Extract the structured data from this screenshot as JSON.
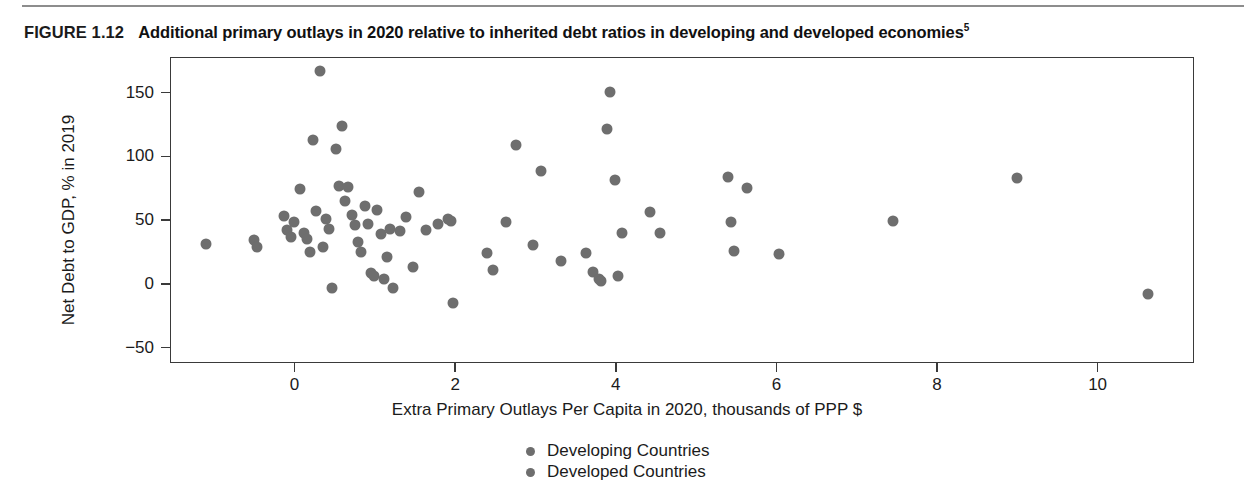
{
  "figure": {
    "number_label": "FIGURE 1.12",
    "title": "Additional primary outlays in 2020 relative to inherited debt ratios in developing and developed economies",
    "title_footnote": "5"
  },
  "chart_data": {
    "type": "scatter",
    "title": "Additional primary outlays in 2020 relative to inherited debt ratios in developing and developed economies",
    "xlabel": "Extra Primary Outlays Per Capita in 2020, thousands of PPP $",
    "ylabel": "Net Debt to GDP, % in 2019",
    "xlim": [
      -1.55,
      11.2
    ],
    "ylim": [
      -62,
      178
    ],
    "xticks": [
      0,
      2,
      4,
      6,
      8,
      10
    ],
    "yticks": [
      -50,
      0,
      50,
      100,
      150
    ],
    "xtick_labels": [
      "0",
      "2",
      "4",
      "6",
      "8",
      "10"
    ],
    "ytick_labels": [
      "−50",
      "0",
      "50",
      "100",
      "150"
    ],
    "grid": false,
    "legend_position": "bottom-center",
    "marker_color": "#6e6e6e",
    "series": [
      {
        "name": "Developing Countries",
        "color": "#6e6e6e",
        "points": [
          [
            -1.12,
            32
          ],
          [
            -0.52,
            35
          ],
          [
            -0.48,
            30
          ],
          [
            -0.14,
            54
          ],
          [
            -0.1,
            43
          ],
          [
            -0.06,
            38
          ],
          [
            -0.02,
            49
          ],
          [
            0.06,
            75
          ],
          [
            0.1,
            41
          ],
          [
            0.14,
            36
          ],
          [
            0.18,
            26
          ],
          [
            0.22,
            114
          ],
          [
            0.26,
            58
          ],
          [
            0.3,
            168
          ],
          [
            0.34,
            30
          ],
          [
            0.38,
            52
          ],
          [
            0.42,
            44
          ],
          [
            0.46,
            -2
          ],
          [
            0.5,
            107
          ],
          [
            0.54,
            78
          ],
          [
            0.58,
            125
          ],
          [
            0.62,
            66
          ],
          [
            0.66,
            77
          ],
          [
            0.7,
            55
          ],
          [
            0.74,
            47
          ],
          [
            0.78,
            34
          ],
          [
            0.82,
            26
          ],
          [
            0.86,
            62
          ],
          [
            0.9,
            48
          ],
          [
            0.94,
            9
          ],
          [
            0.98,
            7
          ],
          [
            1.02,
            59
          ],
          [
            1.06,
            40
          ],
          [
            1.1,
            5
          ],
          [
            1.14,
            22
          ],
          [
            1.18,
            44
          ],
          [
            1.22,
            -2
          ],
          [
            1.3,
            42
          ],
          [
            1.38,
            53
          ],
          [
            1.46,
            14
          ],
          [
            1.54,
            73
          ],
          [
            1.62,
            43
          ],
          [
            1.78,
            48
          ],
          [
            1.9,
            52
          ],
          [
            1.94,
            50
          ],
          [
            1.96,
            -14
          ],
          [
            2.38,
            25
          ],
          [
            2.46,
            12
          ],
          [
            2.62,
            49
          ],
          [
            2.74,
            110
          ],
          [
            2.96,
            31
          ],
          [
            3.06,
            89
          ],
          [
            3.3,
            19
          ],
          [
            3.62,
            25
          ],
          [
            3.7,
            10
          ],
          [
            3.78,
            5
          ],
          [
            3.8,
            3
          ],
          [
            3.88,
            122
          ],
          [
            3.92,
            151
          ],
          [
            3.98,
            82
          ],
          [
            4.02,
            7
          ],
          [
            4.06,
            41
          ],
          [
            4.42,
            57
          ],
          [
            4.54,
            41
          ],
          [
            5.38,
            85
          ],
          [
            5.42,
            49
          ],
          [
            5.46,
            27
          ],
          [
            5.62,
            76
          ],
          [
            6.02,
            24
          ],
          [
            7.44,
            50
          ],
          [
            8.98,
            84
          ],
          [
            10.62,
            -7
          ]
        ]
      },
      {
        "name": "Developed Countries",
        "color": "#6e6e6e",
        "points": []
      }
    ]
  },
  "axes": {
    "y_label": "Net Debt to GDP, % in 2019",
    "x_label": "Extra Primary Outlays Per Capita in 2020, thousands of PPP $"
  },
  "legend": {
    "items": [
      {
        "label": "Developing Countries",
        "color": "#6e6e6e"
      },
      {
        "label": "Developed Countries",
        "color": "#6e6e6e"
      }
    ]
  }
}
